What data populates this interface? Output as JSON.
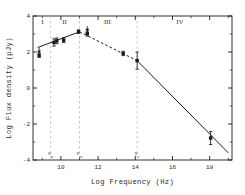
{
  "figure": {
    "background": "#ffffff",
    "ink": "#1b1b1b",
    "guide_color": "#b9b9b9"
  },
  "chart_data": {
    "type": "line",
    "title": "",
    "xlabel": "Log Frequency (Hz)",
    "ylabel": "Log Flux density (μJy)",
    "xlim": [
      8.5,
      19.2
    ],
    "ylim": [
      -4,
      4
    ],
    "xticks": [
      10,
      12,
      14,
      16,
      18
    ],
    "xtick_labels": [
      "10",
      "12",
      "14",
      "16",
      "18"
    ],
    "yticks": [
      4,
      2,
      0,
      -2,
      -4
    ],
    "ytick_labels": [
      "4",
      "2",
      "0",
      "-2",
      "-4"
    ],
    "grid": false,
    "legend": "none",
    "regions": [
      {
        "label": "I",
        "x": 9.0,
        "y": 3.55
      },
      {
        "label": "II",
        "x": 10.2,
        "y": 3.55
      },
      {
        "label": "III",
        "x": 12.5,
        "y": 3.55
      },
      {
        "label": "IV",
        "x": 16.4,
        "y": 3.55
      }
    ],
    "break_frequencies": [
      {
        "name": "nu_a",
        "label": "ν",
        "subscript": "a",
        "x": 9.45
      },
      {
        "name": "nu_m",
        "label": "ν",
        "subscript": "m",
        "x": 11.0
      },
      {
        "name": "nu_c",
        "label": "ν",
        "subscript": "c",
        "x": 14.1
      }
    ],
    "series": [
      {
        "name": "self-absorbed-rise",
        "style": "solid",
        "points": [
          [
            8.75,
            2.25
          ],
          [
            11.0,
            3.12
          ]
        ]
      },
      {
        "name": "optically-thin-decline",
        "style": "dashed",
        "points": [
          [
            11.0,
            3.12
          ],
          [
            14.1,
            1.52
          ]
        ]
      },
      {
        "name": "cooling-decline",
        "style": "solid",
        "points": [
          [
            14.1,
            1.52
          ],
          [
            19.0,
            -3.6
          ]
        ]
      }
    ],
    "data_points": [
      {
        "x": 8.83,
        "y": 1.82,
        "yerr": 0.12,
        "upper_limit": true,
        "marker": "square"
      },
      {
        "x": 9.63,
        "y": 2.53,
        "yerr": 0.2,
        "upper_limit": false,
        "marker": "square"
      },
      {
        "x": 9.78,
        "y": 2.62,
        "yerr": 0.16,
        "upper_limit": false,
        "marker": "square"
      },
      {
        "x": 10.15,
        "y": 2.66,
        "yerr": 0.13,
        "upper_limit": false,
        "marker": "square"
      },
      {
        "x": 10.95,
        "y": 3.13,
        "yerr": 0.1,
        "upper_limit": false,
        "marker": "square"
      },
      {
        "x": 11.42,
        "y": 3.02,
        "yerr": 0.14,
        "upper_limit": true,
        "marker": "square"
      },
      {
        "x": 13.35,
        "y": 1.92,
        "yerr": 0.12,
        "upper_limit": false,
        "marker": "square"
      },
      {
        "x": 14.1,
        "y": 1.52,
        "yerr": 0.48,
        "upper_limit": false,
        "marker": "square"
      },
      {
        "x": 18.05,
        "y": -2.78,
        "yerr": 0.36,
        "upper_limit": false,
        "marker": "square"
      }
    ]
  }
}
